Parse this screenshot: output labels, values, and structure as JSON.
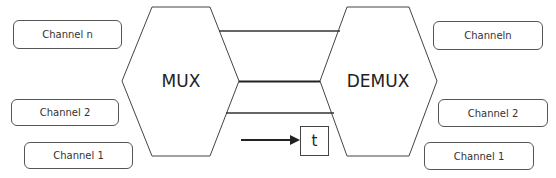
{
  "diagram": {
    "mux": {
      "label": "MUX"
    },
    "demux": {
      "label": "DEMUX"
    },
    "time_label": "t",
    "left_channels": [
      {
        "label": "Channel n"
      },
      {
        "label": "Channel 2"
      },
      {
        "label": "Channel 1"
      }
    ],
    "right_channels": [
      {
        "label": "Channeln"
      },
      {
        "label": "Channel 2"
      },
      {
        "label": "Channel 1"
      }
    ],
    "colors": {
      "stroke": "#444444",
      "text": "#222222",
      "background": "#ffffff"
    }
  }
}
